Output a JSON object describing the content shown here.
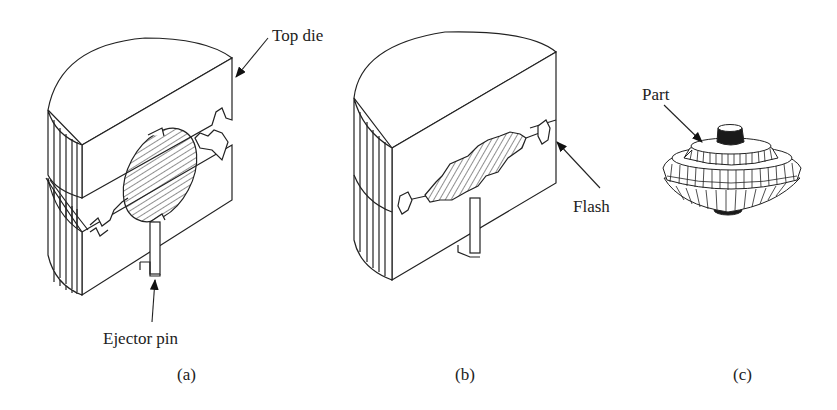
{
  "figure": {
    "panels": [
      {
        "id": "a",
        "caption": "(a)",
        "description": "Open closed-die forging set with workpiece between dies",
        "callouts": [
          {
            "text": "Top die",
            "target": "top-die-corner"
          },
          {
            "text": "Ejector pin",
            "target": "ejector-pin"
          }
        ]
      },
      {
        "id": "b",
        "caption": "(b)",
        "description": "Closed dies with formed workpiece and flash at parting line",
        "callouts": [
          {
            "text": "Flash",
            "target": "flash-at-parting-line"
          }
        ]
      },
      {
        "id": "c",
        "caption": "(c)",
        "description": "Finished forged part",
        "callouts": [
          {
            "text": "Part",
            "target": "forged-part"
          }
        ]
      }
    ],
    "colors": {
      "line": "#222222",
      "background": "#ffffff",
      "dark_fill": "#1a1a1a"
    }
  }
}
